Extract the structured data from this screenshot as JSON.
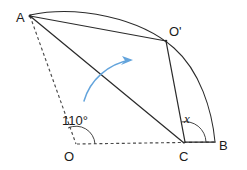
{
  "diagram": {
    "background_color": "#ffffff",
    "ink_color": "#2b2b2b",
    "accent_color": "#63a4dc",
    "points": {
      "A": {
        "label": "A",
        "x": 30,
        "y": 15,
        "label_x": 16,
        "label_y": 22
      },
      "O_prime": {
        "label": "O'",
        "x": 166,
        "y": 40,
        "label_x": 169,
        "label_y": 36
      },
      "O": {
        "label": "O",
        "x": 76,
        "y": 144,
        "label_x": 64,
        "label_y": 160
      },
      "C": {
        "label": "C",
        "x": 185,
        "y": 143,
        "label_x": 179,
        "label_y": 160
      },
      "B": {
        "label": "B",
        "x": 215,
        "y": 142,
        "label_x": 219,
        "label_y": 150
      }
    },
    "angles": {
      "at_O": {
        "label": "110°",
        "value": 110,
        "unit": "degrees",
        "label_x": 63,
        "label_y": 124
      },
      "at_C": {
        "label": "x",
        "value": "x",
        "label_x": 186,
        "label_y": 122
      }
    },
    "segments": [
      {
        "name": "A-to-O-prime",
        "from": "A",
        "to": "O_prime",
        "style": "solid"
      },
      {
        "name": "A-to-C",
        "from": "A",
        "to": "C",
        "style": "solid"
      },
      {
        "name": "O-prime-to-C",
        "from": "O_prime",
        "to": "C",
        "style": "solid"
      },
      {
        "name": "C-to-B",
        "from": "C",
        "to": "B",
        "style": "solid"
      },
      {
        "name": "A-to-O",
        "from": "A",
        "to": "O",
        "style": "dashed"
      },
      {
        "name": "O-to-B",
        "from": "O",
        "to": "B",
        "style": "dashed"
      }
    ],
    "arcs": [
      {
        "name": "arc-A-to-O-prime-to-B",
        "center": "A",
        "from": "A",
        "through": "O_prime",
        "to": "B",
        "style": "solid-thin"
      }
    ],
    "rotation_arrow": {
      "name": "rotation-direction-arrow",
      "color": "#63a4dc",
      "direction": "counterclockwise-to-clockwise-sweep",
      "start_x": 84,
      "start_y": 101,
      "end_x": 132,
      "end_y": 61
    }
  }
}
